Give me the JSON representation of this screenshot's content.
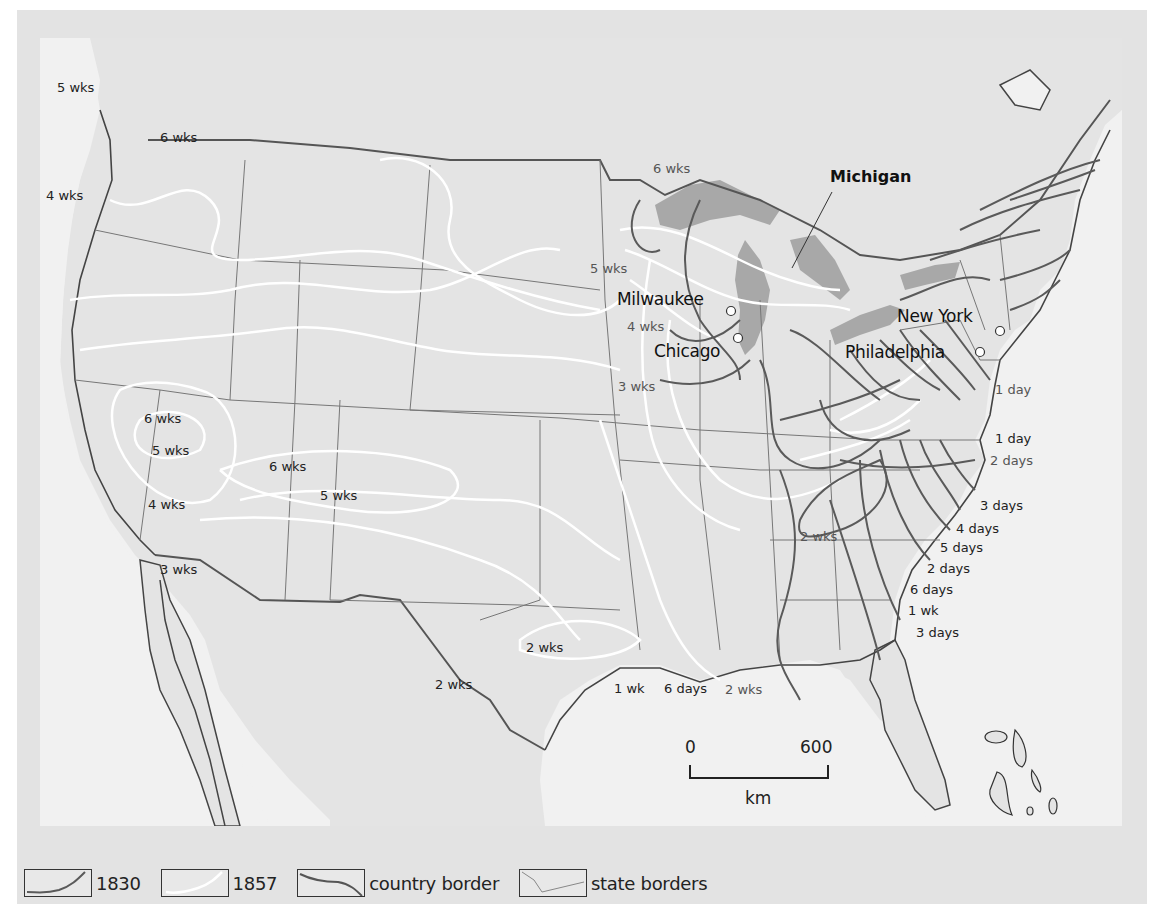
{
  "map": {
    "title": "Travel times from New York, 1830 and 1857",
    "cities": [
      {
        "name": "Milwaukee"
      },
      {
        "name": "Chicago"
      },
      {
        "name": "New York"
      },
      {
        "name": "Philadelphia"
      }
    ],
    "region_label": "Michigan",
    "isochrone_labels_1857": [
      "5 wks",
      "6 wks",
      "4 wks",
      "6 wks",
      "5 wks",
      "4 wks",
      "3 wks",
      "6 wks",
      "5 wks",
      "6 wks",
      "5 wks",
      "4 wks",
      "3 wks",
      "2 wks",
      "2 wks",
      "1 wk",
      "6 days",
      "2 wks"
    ],
    "isochrone_labels_1830": [
      "1 day",
      "1 day",
      "2 days",
      "2 wks",
      "3 days",
      "4 days",
      "5 days",
      "2 days",
      "6 days",
      "1 wk",
      "3 days"
    ],
    "labels": {
      "nw_5wks": "5 wks",
      "nw_6wks": "6 wks",
      "nw_4wks": "4 wks",
      "mn_6wks": "6 wks",
      "mn_5wks": "5 wks",
      "wi_4wks": "4 wks",
      "ia_3wks": "3 wks",
      "ca_6wks": "6 wks",
      "ca_5wks": "5 wks",
      "ca_4wks": "4 wks",
      "ca_3wks": "3 wks",
      "ut_6wks": "6 wks",
      "co_5wks": "5 wks",
      "tx_2wks": "2 wks",
      "rg_2wks": "2 wks",
      "gulf_1wk": "1 wk",
      "gulf_6days": "6 days",
      "gulf_2wks": "2 wks",
      "nj_1day": "1 day",
      "va_1day": "1 day",
      "nc_2days": "2 days",
      "tn_2wks": "2 wks",
      "nc_3days": "3 days",
      "sc_4days": "4 days",
      "sc_5days": "5 days",
      "ga_2days": "2 days",
      "ga_6days": "6 days",
      "ga_1wk": "1 wk",
      "fl_3days": "3 days"
    },
    "scale": {
      "start": "0",
      "end": "600",
      "unit": "km"
    }
  },
  "legend": {
    "items": [
      {
        "label": "1830",
        "color": "#555555"
      },
      {
        "label": "1857",
        "color": "#ffffff"
      },
      {
        "label": "country border",
        "color": "#555555"
      },
      {
        "label": "state borders",
        "color": "#777777"
      }
    ]
  },
  "colors": {
    "land": "#e4e4e4",
    "water": "#f1f1f1",
    "lakes": "#a8a8a8",
    "line_1830": "#5a5a5a",
    "line_1857": "#ffffff",
    "frame": "#e3e3e3"
  }
}
